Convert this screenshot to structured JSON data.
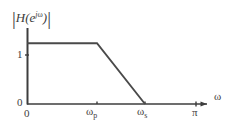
{
  "chart_data": {
    "type": "line",
    "title": "",
    "subtitle": "",
    "xlabel": "ω",
    "ylabel": "|H(e^{jω})|",
    "xlim": [
      0,
      3.6
    ],
    "ylim": [
      0,
      1.25
    ],
    "grid": false,
    "legend": null,
    "x": [
      0,
      1.4,
      2.36
    ],
    "y": [
      1,
      1,
      0
    ],
    "series": [
      {
        "name": "|H(e^{jω})| magnitude response",
        "points": [
          {
            "x": 0,
            "y": 1
          },
          {
            "x": 1.4,
            "y": 1
          },
          {
            "x": 2.36,
            "y": 0
          }
        ]
      }
    ],
    "xticks": [
      {
        "value": 0,
        "label": "0"
      },
      {
        "value": 1.4,
        "label": "ωp"
      },
      {
        "value": 2.36,
        "label": "ωs"
      },
      {
        "value": 3.14159,
        "label": "π"
      }
    ],
    "yticks": [
      {
        "value": 0,
        "label": "0"
      },
      {
        "value": 1,
        "label": "1"
      }
    ],
    "annotations": [
      "Ideal lowpass filter magnitude with linear transition band from passband edge ωp to stopband edge ωs"
    ]
  },
  "figure": {
    "y_axis_title": {
      "open_bar": "|",
      "h": "H",
      "paren_open": "(",
      "e": "e",
      "exponent_j": "j",
      "exponent_omega": "ω",
      "paren_close": ")",
      "close_bar": "|"
    },
    "x_axis_title": "ω",
    "y_tick_one": "1",
    "y_tick_zero": "0",
    "x_tick_zero": "0",
    "x_tick_wp_base": "ω",
    "x_tick_wp_sub": "p",
    "x_tick_ws_base": "ω",
    "x_tick_ws_sub": "s",
    "x_tick_pi": "π"
  },
  "style": {
    "background": "#ffffff",
    "axis_color": "#3d3d3d",
    "curve_color": "#4a4a4a",
    "text_color": "#3d3d3d"
  }
}
